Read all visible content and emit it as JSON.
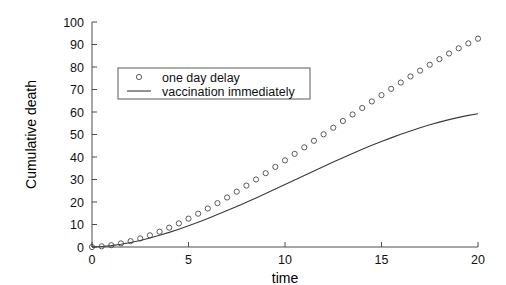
{
  "figure": {
    "background_color": "#ffffff",
    "axis_color": "#4c4c4c",
    "series_color": "#3a3a3a",
    "marker_color": "#4a4a4a"
  },
  "chart_data": {
    "type": "scatter",
    "title": "",
    "xlabel": "time",
    "ylabel": "Cumulative death",
    "xlim": [
      0,
      20
    ],
    "ylim": [
      0,
      100
    ],
    "xticks": [
      0,
      5,
      10,
      15,
      20
    ],
    "yticks": [
      0,
      10,
      20,
      30,
      40,
      50,
      60,
      70,
      80,
      90,
      100
    ],
    "grid": false,
    "legend_position": "upper-left-inset",
    "series": [
      {
        "name": "one day delay",
        "style": "markers",
        "marker": "circle-open",
        "x": [
          0,
          0.5,
          1,
          1.5,
          2,
          2.5,
          3,
          3.5,
          4,
          4.5,
          5,
          5.5,
          6,
          6.5,
          7,
          7.5,
          8,
          8.5,
          9,
          9.5,
          10,
          10.5,
          11,
          11.5,
          12,
          12.5,
          13,
          13.5,
          14,
          14.5,
          15,
          15.5,
          16,
          16.5,
          17,
          17.5,
          18,
          18.5,
          19,
          19.5,
          20
        ],
        "values": [
          0,
          0.3,
          0.8,
          1.6,
          2.6,
          3.8,
          5.2,
          6.8,
          8.6,
          10.5,
          12.6,
          14.8,
          17.1,
          19.5,
          22.0,
          24.6,
          27.3,
          30.0,
          32.8,
          35.6,
          38.5,
          41.4,
          44.3,
          47.2,
          50.1,
          53.0,
          56.0,
          58.9,
          61.8,
          64.7,
          67.5,
          70.3,
          73.1,
          75.8,
          78.4,
          81.0,
          83.5,
          86.0,
          88.3,
          90.5,
          92.6
        ]
      },
      {
        "name": "vaccination immediately",
        "style": "line",
        "marker": "none",
        "x": [
          0,
          0.5,
          1,
          1.5,
          2,
          2.5,
          3,
          3.5,
          4,
          4.5,
          5,
          5.5,
          6,
          6.5,
          7,
          7.5,
          8,
          8.5,
          9,
          9.5,
          10,
          10.5,
          11,
          11.5,
          12,
          12.5,
          13,
          13.5,
          14,
          14.5,
          15,
          15.5,
          16,
          16.5,
          17,
          17.5,
          18,
          18.5,
          19,
          19.5,
          20
        ],
        "values": [
          0,
          0.2,
          0.6,
          1.2,
          2.0,
          2.9,
          4.0,
          5.2,
          6.5,
          7.9,
          9.4,
          11.0,
          12.7,
          14.4,
          16.2,
          18.0,
          19.9,
          21.8,
          23.8,
          25.8,
          27.8,
          29.8,
          31.8,
          33.8,
          35.8,
          37.8,
          39.7,
          41.6,
          43.4,
          45.2,
          46.9,
          48.5,
          50.1,
          51.6,
          53.0,
          54.3,
          55.5,
          56.6,
          57.6,
          58.5,
          59.2
        ]
      }
    ],
    "legend": [
      {
        "label": "one day delay",
        "marker": "circle-open"
      },
      {
        "label": "vaccination immediately",
        "marker": "line"
      }
    ]
  },
  "axis_labels": {
    "x_title": "time",
    "y_title": "Cumulative death"
  }
}
